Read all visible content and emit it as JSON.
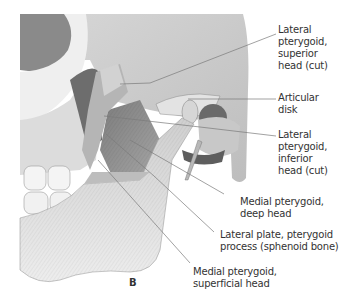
{
  "figure": {
    "panel_letter": "B",
    "colors": {
      "bone_light": "#e6e6e6",
      "bone_mid": "#c9c9c9",
      "muscle": "#8e8e8e",
      "shadow": "#5a5a5a",
      "leader_line": "#7a7a7a",
      "label_text": "#333333"
    },
    "labels": [
      {
        "id": "lateral-pterygoid-superior-head",
        "lines": [
          "Lateral",
          "pterygoid,",
          "superior",
          "head (cut)"
        ]
      },
      {
        "id": "articular-disk",
        "lines": [
          "Articular",
          "disk"
        ]
      },
      {
        "id": "lateral-pterygoid-inferior-head",
        "lines": [
          "Lateral",
          "pterygoid,",
          "inferior",
          "head (cut)"
        ]
      },
      {
        "id": "medial-pterygoid-deep-head",
        "lines": [
          "Medial pterygoid,",
          "deep head"
        ]
      },
      {
        "id": "lateral-plate-pterygoid-process",
        "lines": [
          "Lateral plate, pterygoid",
          "process (sphenoid bone)"
        ]
      },
      {
        "id": "medial-pterygoid-superficial-head",
        "lines": [
          "Medial pterygoid,",
          "superficial head"
        ]
      }
    ]
  }
}
